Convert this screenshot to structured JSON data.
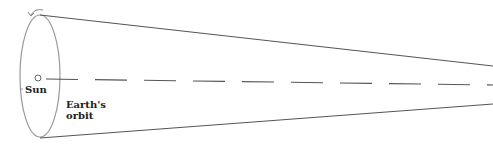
{
  "diagram": {
    "labels": {
      "sun": "Sun",
      "orbit_line1": "Earth's",
      "orbit_line2": "orbit"
    },
    "colors": {
      "stroke": "#555555",
      "ellipse": "#999999",
      "text": "#222222"
    }
  }
}
